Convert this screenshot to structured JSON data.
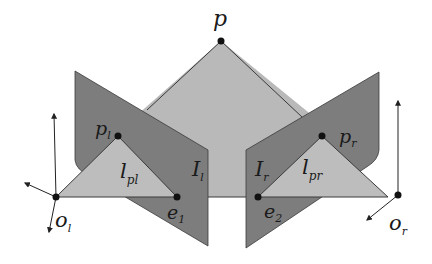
{
  "diagram": {
    "colors": {
      "background": "#ffffff",
      "epipolar_plane": "#b9b9b9",
      "image_plane": "#7d7d7d",
      "projection_triangle": "#bdbdbd",
      "edge": "#3a3a3a",
      "point": "#111111"
    },
    "labels": {
      "p": {
        "main": "p",
        "sub": ""
      },
      "p_l": {
        "main": "p",
        "sub": "l"
      },
      "p_r": {
        "main": "p",
        "sub": "r"
      },
      "l_pl": {
        "main": "l",
        "sub": "pl"
      },
      "l_pr": {
        "main": "l",
        "sub": "pr"
      },
      "I_l": {
        "main": "I",
        "sub": "l"
      },
      "I_r": {
        "main": "I",
        "sub": "r"
      },
      "e_1": {
        "main": "e",
        "sub": "1"
      },
      "e_2": {
        "main": "e",
        "sub": "2"
      },
      "o_l": {
        "main": "o",
        "sub": "l"
      },
      "o_r": {
        "main": "o",
        "sub": "r"
      }
    },
    "points": {
      "p": [
        221,
        41
      ],
      "p_l": [
        118,
        136
      ],
      "p_r": [
        322,
        136
      ],
      "e_1": [
        177,
        197
      ],
      "e_2": [
        258,
        197
      ],
      "o_l": [
        56,
        197
      ],
      "o_r": [
        398,
        195
      ]
    }
  }
}
